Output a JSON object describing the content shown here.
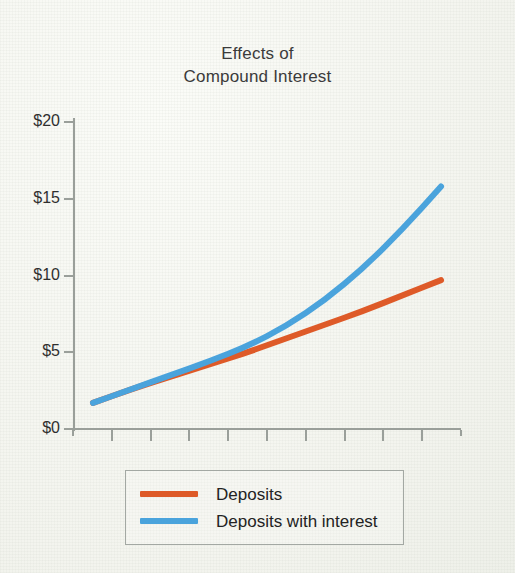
{
  "chart_data": {
    "type": "line",
    "title": "Effects of Compound Interest",
    "title_lines": [
      "Effects of",
      "Compound Interest"
    ],
    "xlabel": "",
    "ylabel": "",
    "ylim": [
      0,
      20
    ],
    "xlim": [
      0,
      10
    ],
    "grid": false,
    "legend_position": "below-plot",
    "y_tick_labels": [
      "$20",
      "$15",
      "$10",
      "$5",
      "$0"
    ],
    "y_tick_values": [
      20,
      15,
      10,
      5,
      0
    ],
    "x_tick_labels": [
      "",
      "",
      "",
      "",
      "",
      "",
      "",
      "",
      "",
      "",
      ""
    ],
    "x_tick_count": 11,
    "x": [
      0,
      1,
      2,
      3,
      4,
      5,
      6,
      7,
      8,
      9
    ],
    "series": [
      {
        "name": "Deposits",
        "color": "#de5a28",
        "values": [
          1.7,
          2.6,
          3.4,
          4.2,
          5.0,
          5.9,
          6.8,
          7.7,
          8.7,
          9.7
        ]
      },
      {
        "name": "Deposits with interest",
        "color": "#4aa3dc",
        "values": [
          1.7,
          2.6,
          3.5,
          4.4,
          5.4,
          6.7,
          8.4,
          10.5,
          13.0,
          15.8
        ]
      }
    ]
  },
  "chart": {
    "title_line_1": "Effects of",
    "title_line_2": "Compound Interest",
    "axis_color": "#9a9f9a",
    "text_color": "#2f2f2f",
    "background_color": "#f5f6f1"
  },
  "legend": {
    "items": [
      {
        "label": "Deposits",
        "color": "#de5a28"
      },
      {
        "label": "Deposits with interest",
        "color": "#4aa3dc"
      }
    ]
  }
}
